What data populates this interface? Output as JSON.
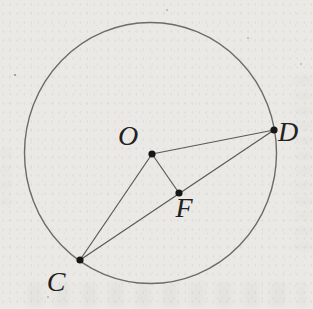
{
  "page": {
    "kind": "scanned geometry figure",
    "background_color": "#eae9e5"
  },
  "diagram": {
    "figure": "circle with center and chord",
    "labels": {
      "O": "O",
      "D": "D",
      "F": "F",
      "C": "C"
    },
    "points_on_circle": [
      "C",
      "D"
    ],
    "center_point": "O",
    "point_on_chord": "F",
    "segments": [
      "OD",
      "OC",
      "OF",
      "CD"
    ],
    "colors": {
      "circle_stroke": "#6e6c66",
      "segment_stroke": "#5b5954",
      "point_fill": "#161616",
      "label_color": "#23211e"
    }
  }
}
